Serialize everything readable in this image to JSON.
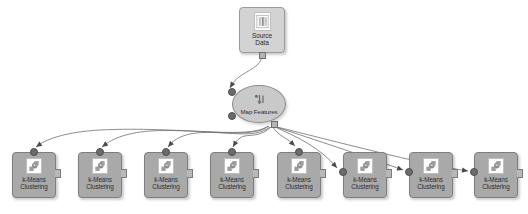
{
  "canvas": {
    "width": 528,
    "height": 214,
    "background_color": "#ffffff",
    "edge_color": "#6f6f6f",
    "node_fill_color": "#a9a9a9",
    "node_border_color": "#7e7e7e",
    "ellipse_fill_color": "#c9c9c9",
    "port_color": "#6b6b6b",
    "label_color": "#2d2d2d"
  },
  "source_node": {
    "label_line1": "Source",
    "label_line2": "Data",
    "icon": "table-document-icon",
    "shape": "rounded-rectangle",
    "x": 239,
    "y": 7,
    "width": 46,
    "height": 46
  },
  "transform_node": {
    "label": "Map Features",
    "icon": "map-features-icon",
    "shape": "ellipse",
    "x": 232,
    "y": 85,
    "width": 54,
    "height": 38
  },
  "cluster_nodes": [
    {
      "label_line1": "k-Means",
      "label_line2": "Clustering",
      "icon": "k-means-icon",
      "x": 12,
      "y": 152,
      "width": 44,
      "height": 46,
      "port_side": "top"
    },
    {
      "label_line1": "k-Means",
      "label_line2": "Clustering",
      "icon": "k-means-icon",
      "x": 78,
      "y": 152,
      "width": 44,
      "height": 46,
      "port_side": "top"
    },
    {
      "label_line1": "k-Means",
      "label_line2": "Clustering",
      "icon": "k-means-icon",
      "x": 144,
      "y": 152,
      "width": 44,
      "height": 46,
      "port_side": "top"
    },
    {
      "label_line1": "k-Means",
      "label_line2": "Clustering",
      "icon": "k-means-icon",
      "x": 210,
      "y": 152,
      "width": 44,
      "height": 46,
      "port_side": "top"
    },
    {
      "label_line1": "k-Means",
      "label_line2": "Clustering",
      "icon": "k-means-icon",
      "x": 277,
      "y": 152,
      "width": 44,
      "height": 46,
      "port_side": "top"
    },
    {
      "label_line1": "k-Means",
      "label_line2": "Clustering",
      "icon": "k-means-icon",
      "x": 343,
      "y": 152,
      "width": 44,
      "height": 46,
      "port_side": "left"
    },
    {
      "label_line1": "k-Means",
      "label_line2": "Clustering",
      "icon": "k-means-icon",
      "x": 409,
      "y": 152,
      "width": 44,
      "height": 46,
      "port_side": "left"
    },
    {
      "label_line1": "k-Means",
      "label_line2": "Clustering",
      "icon": "k-means-icon",
      "x": 474,
      "y": 152,
      "width": 44,
      "height": 46,
      "port_side": "left"
    }
  ],
  "edges": [
    {
      "from": "source_node",
      "to": "transform_node",
      "path": "M 262,55 C 262,70 236,72 230,88"
    },
    {
      "from": "transform_node",
      "to": "cluster_node_1",
      "path": "M 268,126 C 250,140 180,126 100,130 C 64,132 44,140 36,147"
    },
    {
      "from": "transform_node",
      "to": "cluster_node_2",
      "path": "M 269,126 C 252,140 200,128 150,131 C 124,133 110,140 102,147"
    },
    {
      "from": "transform_node",
      "to": "cluster_node_3",
      "path": "M 270,127 C 254,140 224,130 196,133 C 180,135 172,141 168,147"
    },
    {
      "from": "transform_node",
      "to": "cluster_node_4",
      "path": "M 271,127 C 258,139 246,133 240,138 C 236,141 234,144 233,147"
    },
    {
      "from": "transform_node",
      "to": "cluster_node_5",
      "path": "M 273,127 C 278,136 288,138 295,146"
    },
    {
      "from": "transform_node",
      "to": "cluster_node_6",
      "path": "M 275,127 C 295,136 320,147 337,168"
    },
    {
      "from": "transform_node",
      "to": "cluster_node_7",
      "path": "M 276,127 C 310,138 370,158 403,170"
    },
    {
      "from": "transform_node",
      "to": "cluster_node_8",
      "path": "M 277,127 C 330,140 420,164 468,171"
    }
  ]
}
